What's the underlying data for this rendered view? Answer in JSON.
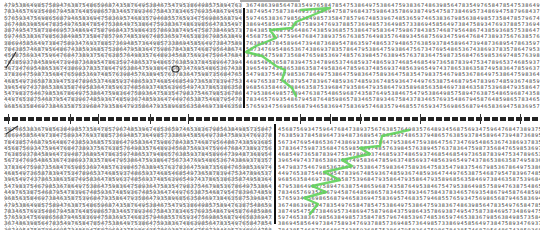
{
  "document": {
    "type": "number-cancellation-test-sheet",
    "halves": [
      {
        "id": "top",
        "top": 2,
        "height": 106,
        "divider_x": 243,
        "rows": 17,
        "crossed_region": {
          "x": 4,
          "width": 238
        },
        "clean_region": {
          "x": 246,
          "width": 294
        },
        "bottom_rows_sample": [
          "5 6 9 7 5 2 8 4 6 7 5 8 6 3 4 7 8 5 4 3 8 6 5 7 4 6 3 8 2 4 7 5 8 3 6 4",
          "7 3 8 6 7 4 9 8 5 7 3 8 9 4 6 8 3 5 9 7 4 3 8 6 7 9 3 3 4 7 8 5 9 4 5 6"
        ]
      },
      {
        "id": "bottom",
        "top": 126,
        "height": 104,
        "divider_x": 274,
        "rows": 17,
        "crossed_region": {
          "x": 4,
          "width": 268
        },
        "clean_region": {
          "x": 278,
          "width": 262
        }
      }
    ],
    "digit_rows": [
      "4 7 9 5 3 8 6 4 9 8 5 7 5 8 9 4 7 6 3 8 7 5 4 8 6 5 9 6 8 7 4 3 5 8 7 6 4 9 5 3 8 4 6 7 5",
      "7 8 3 4 6 5 7 6 9 3 5 4 8 6 7 9 4 5 8 7 6 4 8 5 9 8 6 5 7 8 3 4 6 5 7 8 9 3 4 6 7 5 8 4 3",
      "5 7 6 5 9 3 4 7 5 6 9 8 6 5 6 8 7 9 4 6 5 8 3 6 9 4 7 5 8 3 6 9 5 7 4 6 8 3 5 7 9 4 6 8 5",
      "3 6 7 4 8 6 3 9 8 5 6 4 7 8 3 5 4 9 7 6 5 8 4 7 8 5 4 7 5 3 8 6 4 9 7 5 3 8 6 4 7 5 9 3 8",
      "3 8 7 4 9 5 4 7 5 8 7 3 8 4 6 9 5 7 3 4 8 6 9 4 7 5 8 7 9 6 8 4 3 7 5 9 8 6 4 3 5 7 8 6 9",
      "5 9 7 4 6 5 3 8 3 6 7 9 8 5 6 3 8 4 9 8 5 7 3 5 8 4 7 8 5 7 9 6 7 4 8 5 3 9 6 7 4 8 5 3 6",
      "3 8 6 9 4 5 8 5 6 4 9 7 3 8 4 7 5 8 9 3 4 7 6 9 3 7 8 8 5 7 3 6 9 4 8 5 7 3 6 4 9 8 5 7 3",
      "7 8 4 3 8 5 7 4 6 8 7 9 5 6 4 8 6 7 4 3 8 5 9 3 6 8 5 7 5 3 8 6 4 7 9 5 8 3 6 4 7 5 9 8 6",
      "4 5 6 8 7 5 6 9 3 4 7 5 9 6 4 7 6 8 4 7 3 8 9 3 7 5 6 7 6 3 8 5 7 6 4 9 8 3 5 7 6 4 8 9 3",
      "7 6 3 8 5 9 3 7 8 4 5 8 9 6 4 7 3 9 4 8 7 3 6 8 9 5 4 7 8 6 3 5 9 7 4 8 6 5 3 7 9 4 8 6 5",
      "5 6 7 3 4 7 6 9 5 4 8 6 5 3 6 7 4 3 8 6 9 3 7 8 3 5 7 8 6 4 7 9 5 3 8 6 4 7 5 9 3 8 6 4 7",
      "3 7 8 3 6 4 7 5 9 8 7 3 5 6 8 4 7 6 5 9 8 5 3 6 9 7 4 8 5 7 6 3 9 8 4 5 7 6 3 8 9 4 5 7 6",
      "4 6 8 5 4 9 7 3 6 5 8 7 8 3 9 4 7 5 3 4 7 8 9 6 5 3 7 4 6 8 5 9 3 7 4 8 6 5 9 3 7 4 6 8 5",
      "3 9 6 5 4 9 7 4 3 7 8 6 5 3 8 6 3 5 8 7 4 9 5 8 3 6 4 7 8 5 9 6 3 7 4 8 5 6 9 3 7 4 8 5 6",
      "5 4 7 9 8 3 7 5 4 6 7 9 8 5 3 6 7 8 6 4 9 7 5 3 8 6 4 7 5 9 8 3 6 4 7 5 8 9 3 6 4 7 5 8 3",
      "4 4 9 7 6 5 3 8 7 5 4 6 8 7 9 5 4 7 8 3 9 6 7 4 8 5 9 3 6 7 4 8 5 9 3 6 7 4 8 5 9 3 6 4 7",
      "9 6 8 5 6 3 5 8 4 6 9 7 3 8 4 6 3 5 8 7 5 3 9 6 8 4 7 9 3 5 8 6 4 7 9 3 5 8 6 4 7 9 3 5 8"
    ],
    "annotations": {
      "highlighter_color": "#5fd35a",
      "pencil_color": "#333333",
      "top_trace": "301,10 330,8 296,22 292,28 270,30 276,38 256,46 246,52 262,56 276,66 285,70 282,80 292,88 296,96",
      "bottom_trace": "409,130 382,136 380,146 360,148 370,154 342,160 352,166 324,172 340,180 312,186 326,192 304,198 318,204 310,214",
      "pencil_marks": [
        {
          "shape": "slash",
          "x": 6,
          "y": 52,
          "w": 10,
          "h": 16
        },
        {
          "shape": "slash",
          "x": 6,
          "y": 126,
          "w": 12,
          "h": 8
        },
        {
          "shape": "circle",
          "x": 172,
          "y": 66,
          "w": 7,
          "h": 6
        }
      ]
    }
  }
}
